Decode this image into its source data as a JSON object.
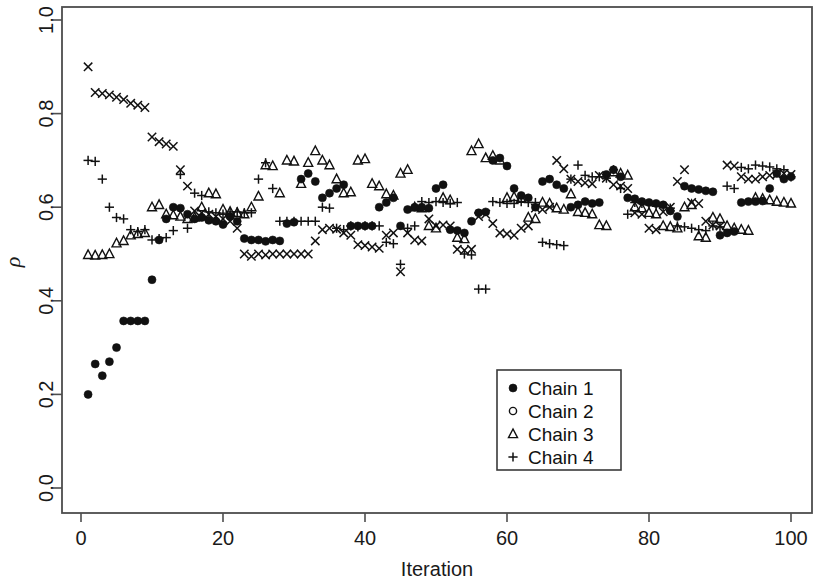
{
  "chart_data": {
    "type": "scatter",
    "title": "",
    "xlabel": "Iteration",
    "ylabel": "ρ",
    "xlim": [
      0,
      103
    ],
    "ylim": [
      0.0,
      1.0
    ],
    "grid": false,
    "xticks": [
      0,
      20,
      40,
      60,
      80,
      100
    ],
    "xtick_labels": [
      "0",
      "20",
      "40",
      "60",
      "80",
      "100"
    ],
    "yticks": [
      0.0,
      0.2,
      0.4,
      0.6,
      0.8,
      1.0
    ],
    "ytick_labels": [
      "0.0",
      "0.2",
      "0.4",
      "0.6",
      "0.8",
      "1.0"
    ],
    "legend_position": "center-right",
    "series": [
      {
        "name": "Chain 1",
        "marker": "filled-circle",
        "color": "#111111",
        "x": [
          1,
          2,
          3,
          4,
          5,
          6,
          7,
          8,
          9,
          10,
          11,
          12,
          13,
          14,
          15,
          16,
          17,
          18,
          19,
          20,
          21,
          22,
          23,
          24,
          25,
          26,
          27,
          28,
          29,
          30,
          31,
          32,
          33,
          34,
          35,
          36,
          37,
          38,
          39,
          40,
          41,
          42,
          43,
          44,
          45,
          46,
          47,
          48,
          49,
          50,
          51,
          52,
          53,
          54,
          55,
          56,
          57,
          58,
          59,
          60,
          61,
          62,
          63,
          64,
          65,
          66,
          67,
          68,
          69,
          70,
          71,
          72,
          73,
          74,
          75,
          76,
          77,
          78,
          79,
          80,
          81,
          82,
          83,
          84,
          85,
          86,
          87,
          88,
          89,
          90,
          91,
          92,
          93,
          94,
          95,
          96,
          97,
          98,
          99,
          100
        ],
        "y": [
          0.2,
          0.265,
          0.24,
          0.27,
          0.3,
          0.357,
          0.357,
          0.357,
          0.357,
          0.445,
          0.53,
          0.575,
          0.6,
          0.598,
          0.585,
          0.575,
          0.578,
          0.572,
          0.57,
          0.563,
          0.58,
          0.57,
          0.533,
          0.53,
          0.53,
          0.527,
          0.53,
          0.528,
          0.565,
          0.568,
          0.66,
          0.672,
          0.655,
          0.62,
          0.63,
          0.64,
          0.648,
          0.56,
          0.56,
          0.56,
          0.56,
          0.6,
          0.61,
          0.62,
          0.56,
          0.595,
          0.6,
          0.6,
          0.598,
          0.64,
          0.648,
          0.552,
          0.55,
          0.545,
          0.57,
          0.588,
          0.59,
          0.7,
          0.705,
          0.688,
          0.64,
          0.625,
          0.62,
          0.6,
          0.655,
          0.66,
          0.648,
          0.64,
          0.6,
          0.605,
          0.612,
          0.608,
          0.61,
          0.67,
          0.68,
          0.665,
          0.62,
          0.618,
          0.612,
          0.61,
          0.608,
          0.605,
          0.592,
          0.58,
          0.645,
          0.64,
          0.638,
          0.635,
          0.633,
          0.54,
          0.545,
          0.548,
          0.61,
          0.612,
          0.612,
          0.613,
          0.64,
          0.672,
          0.66,
          0.665
        ]
      },
      {
        "name": "Chain 2",
        "marker": "open-circle",
        "color": "#111111",
        "x": [
          1,
          2,
          3,
          4,
          5,
          6,
          7,
          8,
          9,
          10,
          11,
          12,
          13,
          14,
          15,
          16,
          17,
          18,
          19,
          20,
          21,
          22,
          23,
          24,
          25,
          26,
          27,
          28,
          29,
          30,
          31,
          32,
          33,
          34,
          35,
          36,
          37,
          38,
          39,
          40,
          41,
          42,
          43,
          44,
          45,
          46,
          47,
          48,
          49,
          50,
          51,
          52,
          53,
          54,
          55,
          56,
          57,
          58,
          59,
          60,
          61,
          62,
          63,
          64,
          65,
          66,
          67,
          68,
          69,
          70,
          71,
          72,
          73,
          74,
          75,
          76,
          77,
          78,
          79,
          80,
          81,
          82,
          83,
          84,
          85,
          86,
          87,
          88,
          89,
          90,
          91,
          92,
          93,
          94,
          95,
          96,
          97,
          98,
          99,
          100
        ],
        "y": [
          0.9,
          0.845,
          0.843,
          0.84,
          0.835,
          0.83,
          0.822,
          0.818,
          0.813,
          0.75,
          0.74,
          0.735,
          0.73,
          0.68,
          0.645,
          0.592,
          0.588,
          0.585,
          0.58,
          0.575,
          0.57,
          0.555,
          0.5,
          0.495,
          0.5,
          0.498,
          0.5,
          0.5,
          0.5,
          0.5,
          0.5,
          0.5,
          0.528,
          0.552,
          0.555,
          0.553,
          0.545,
          0.54,
          0.52,
          0.518,
          0.515,
          0.512,
          0.54,
          0.545,
          0.462,
          0.545,
          0.53,
          0.528,
          0.575,
          0.56,
          0.562,
          0.56,
          0.51,
          0.508,
          0.51,
          0.58,
          0.585,
          0.565,
          0.545,
          0.543,
          0.54,
          0.555,
          0.56,
          0.598,
          0.595,
          0.6,
          0.7,
          0.682,
          0.66,
          0.655,
          0.652,
          0.65,
          0.668,
          0.662,
          0.648,
          0.645,
          0.64,
          0.588,
          0.585,
          0.555,
          0.552,
          0.59,
          0.6,
          0.655,
          0.68,
          0.61,
          0.608,
          0.57,
          0.562,
          0.56,
          0.69,
          0.688,
          0.665,
          0.66,
          0.66,
          0.665,
          0.668,
          0.67,
          0.672,
          0.67
        ]
      },
      {
        "name": "Chain 3",
        "marker": "triangle",
        "color": "#111111",
        "x": [
          1,
          2,
          3,
          4,
          5,
          6,
          7,
          8,
          9,
          10,
          11,
          12,
          13,
          14,
          15,
          16,
          17,
          18,
          19,
          20,
          21,
          22,
          23,
          24,
          25,
          26,
          27,
          28,
          29,
          30,
          31,
          32,
          33,
          34,
          35,
          36,
          37,
          38,
          39,
          40,
          41,
          42,
          43,
          44,
          45,
          46,
          47,
          48,
          49,
          50,
          51,
          52,
          53,
          54,
          55,
          56,
          57,
          58,
          59,
          60,
          61,
          62,
          63,
          64,
          65,
          66,
          67,
          68,
          69,
          70,
          71,
          72,
          73,
          74,
          75,
          76,
          77,
          78,
          79,
          80,
          81,
          82,
          83,
          84,
          85,
          86,
          87,
          88,
          89,
          90,
          91,
          92,
          93,
          94,
          95,
          96,
          97,
          98,
          99,
          100
        ],
        "y": [
          0.498,
          0.497,
          0.498,
          0.5,
          0.523,
          0.528,
          0.54,
          0.543,
          0.545,
          0.6,
          0.605,
          0.585,
          0.583,
          0.58,
          0.575,
          0.578,
          0.6,
          0.63,
          0.628,
          0.595,
          0.59,
          0.588,
          0.585,
          0.6,
          0.623,
          0.69,
          0.688,
          0.63,
          0.7,
          0.698,
          0.65,
          0.695,
          0.72,
          0.7,
          0.69,
          0.66,
          0.63,
          0.632,
          0.7,
          0.703,
          0.65,
          0.645,
          0.628,
          0.625,
          0.672,
          0.68,
          0.6,
          0.598,
          0.56,
          0.555,
          0.62,
          0.615,
          0.535,
          0.532,
          0.72,
          0.735,
          0.705,
          0.71,
          0.7,
          0.62,
          0.622,
          0.618,
          0.578,
          0.575,
          0.61,
          0.608,
          0.598,
          0.595,
          0.628,
          0.59,
          0.588,
          0.585,
          0.562,
          0.56,
          0.675,
          0.672,
          0.668,
          0.6,
          0.598,
          0.588,
          0.585,
          0.56,
          0.558,
          0.555,
          0.6,
          0.605,
          0.538,
          0.535,
          0.578,
          0.575,
          0.56,
          0.555,
          0.552,
          0.55,
          0.62,
          0.618,
          0.615,
          0.612,
          0.61,
          0.608
        ]
      },
      {
        "name": "Chain 4",
        "marker": "plus",
        "color": "#111111",
        "x": [
          1,
          2,
          3,
          4,
          5,
          6,
          7,
          8,
          9,
          10,
          11,
          12,
          13,
          14,
          15,
          16,
          17,
          18,
          19,
          20,
          21,
          22,
          23,
          24,
          25,
          26,
          27,
          28,
          29,
          30,
          31,
          32,
          33,
          34,
          35,
          36,
          37,
          38,
          39,
          40,
          41,
          42,
          43,
          44,
          45,
          46,
          47,
          48,
          49,
          50,
          51,
          52,
          53,
          54,
          55,
          56,
          57,
          58,
          59,
          60,
          61,
          62,
          63,
          64,
          65,
          66,
          67,
          68,
          69,
          70,
          71,
          72,
          73,
          74,
          75,
          76,
          77,
          78,
          79,
          80,
          81,
          82,
          83,
          84,
          85,
          86,
          87,
          88,
          89,
          90,
          91,
          92,
          93,
          94,
          95,
          96,
          97,
          98,
          99,
          100
        ],
        "y": [
          0.7,
          0.698,
          0.66,
          0.6,
          0.578,
          0.575,
          0.552,
          0.548,
          0.552,
          0.53,
          0.533,
          0.535,
          0.55,
          0.67,
          0.555,
          0.63,
          0.625,
          0.59,
          0.588,
          0.585,
          0.59,
          0.59,
          0.588,
          0.588,
          0.66,
          0.695,
          0.64,
          0.57,
          0.57,
          0.57,
          0.57,
          0.57,
          0.57,
          0.6,
          0.598,
          0.555,
          0.552,
          0.56,
          0.558,
          0.56,
          0.56,
          0.56,
          0.525,
          0.522,
          0.478,
          0.555,
          0.56,
          0.612,
          0.61,
          0.612,
          0.61,
          0.608,
          0.61,
          0.5,
          0.498,
          0.425,
          0.425,
          0.612,
          0.61,
          0.608,
          0.608,
          0.612,
          0.61,
          0.61,
          0.525,
          0.522,
          0.52,
          0.518,
          0.66,
          0.69,
          0.668,
          0.665,
          0.665,
          0.662,
          0.68,
          0.64,
          0.585,
          0.61,
          0.608,
          0.605,
          0.602,
          0.6,
          0.598,
          0.56,
          0.558,
          0.555,
          0.552,
          0.55,
          0.56,
          0.558,
          0.645,
          0.64,
          0.685,
          0.682,
          0.69,
          0.688,
          0.686,
          0.682,
          0.68,
          0.665
        ]
      }
    ]
  },
  "legend": {
    "entries": [
      {
        "label": "Chain 1",
        "marker": "filled-circle"
      },
      {
        "label": "Chain 2",
        "marker": "open-circle"
      },
      {
        "label": "Chain 3",
        "marker": "triangle"
      },
      {
        "label": "Chain 4",
        "marker": "plus"
      }
    ]
  },
  "colors": {
    "marker": "#111111",
    "axis": "#4d4d4d",
    "background": "#ffffff",
    "legend_border": "#3a3a3a"
  }
}
